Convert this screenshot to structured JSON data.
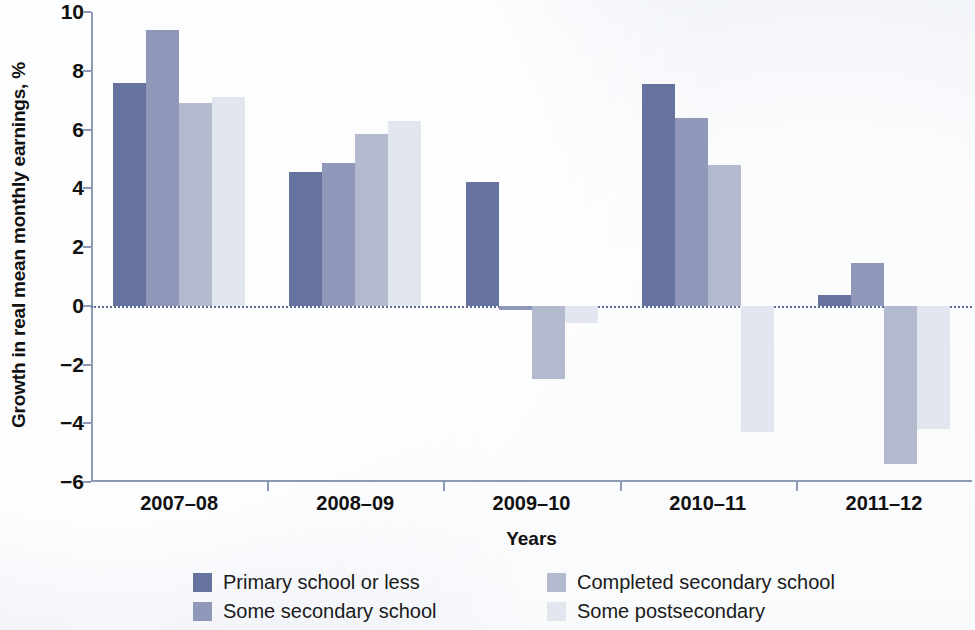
{
  "chart_data": {
    "type": "bar",
    "title": "",
    "xlabel": "Years",
    "ylabel": "Growth in real mean monthly earnings, %",
    "categories": [
      "2007–08",
      "2008–09",
      "2009–10",
      "2010–11",
      "2011–12"
    ],
    "ylim": [
      -6,
      10
    ],
    "yticks": [
      10,
      8,
      6,
      4,
      2,
      0,
      -2,
      -4,
      -6
    ],
    "ytick_labels": [
      "10",
      "8",
      "6",
      "4",
      "2",
      "0",
      "−2",
      "−4",
      "−6"
    ],
    "grid": false,
    "zero_line": true,
    "legend_position": "bottom",
    "series": [
      {
        "name": "Primary school or less",
        "color": "#67739f",
        "values": [
          7.6,
          4.55,
          4.2,
          7.55,
          0.35
        ]
      },
      {
        "name": "Some secondary school",
        "color": "#9098ba",
        "values": [
          9.4,
          4.85,
          -0.15,
          6.4,
          1.45
        ]
      },
      {
        "name": "Completed secondary school",
        "color": "#b3bacd",
        "values": [
          6.9,
          5.85,
          -2.5,
          4.8,
          -5.4
        ]
      },
      {
        "name": "Some postsecondary",
        "color": "#e2e6ef",
        "values": [
          7.1,
          6.3,
          -0.6,
          -4.3,
          -4.2
        ]
      }
    ]
  },
  "legend": {
    "items": [
      {
        "label": "Primary school or less",
        "color": "#67739f"
      },
      {
        "label": "Some secondary school",
        "color": "#9098ba"
      },
      {
        "label": "Completed secondary school",
        "color": "#b3bacd"
      },
      {
        "label": "Some postsecondary",
        "color": "#e2e6ef"
      }
    ]
  },
  "axes": {
    "y_title": "Growth in real mean monthly earnings, %",
    "x_title": "Years"
  }
}
